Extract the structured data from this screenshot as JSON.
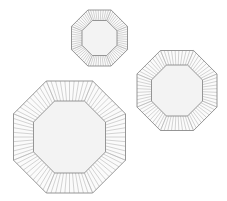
{
  "image": {
    "description": "Three octagonal plates with ribbed/pleated rims on white background",
    "background": "#ffffff",
    "line_color": "#8a8a8a",
    "rim_line_color": "#b0b0b0",
    "center_fill": "#f3f3f3",
    "rim_fill": "#fbfbfb"
  },
  "plates": [
    {
      "name": "small-plate",
      "label": "Small octagonal plate",
      "cx": 99.5,
      "cy": 38,
      "outer": 28,
      "inner": 17.5,
      "ribs_per_side": 9
    },
    {
      "name": "medium-plate",
      "label": "Medium octagonal plate",
      "cx": 177,
      "cy": 90.5,
      "outer": 40,
      "inner": 25.5,
      "ribs_per_side": 9
    },
    {
      "name": "large-plate",
      "label": "Large octagonal plate",
      "cx": 69.5,
      "cy": 137,
      "outer": 56,
      "inner": 36,
      "ribs_per_side": 10
    }
  ]
}
